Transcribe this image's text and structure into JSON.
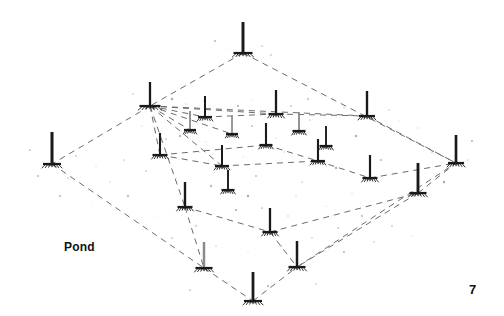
{
  "figure": {
    "pond_label": "Pond",
    "page_number": "7",
    "colors": {
      "background": "#ffffff",
      "pole_dark": "#1a1a1a",
      "pole_gray": "#8a8a8a",
      "link_line": "#6b6b6b",
      "speckle": "#9a9a9a",
      "text": "#111111"
    },
    "link_style": {
      "dash_pattern": "6 5",
      "stroke_width": 1.0
    },
    "hub_node_index": 1,
    "perimeter_path": [
      0,
      1,
      3,
      21,
      22,
      20
    ],
    "nodes": [
      {
        "id": "n0",
        "name": "apex-top",
        "x": 243,
        "y": 53,
        "pole_height": 31,
        "pole_shade": "dark",
        "base_width": 19
      },
      {
        "id": "n1",
        "name": "hub-left-upper",
        "x": 150,
        "y": 106,
        "pole_height": 24,
        "pole_shade": "dark",
        "base_width": 21
      },
      {
        "id": "n2",
        "name": "node-r1-a",
        "x": 205,
        "y": 117,
        "pole_height": 21,
        "pole_shade": "dark",
        "base_width": 14
      },
      {
        "id": "n3",
        "name": "node-r1-b",
        "x": 276,
        "y": 114,
        "pole_height": 24,
        "pole_shade": "dark",
        "base_width": 15
      },
      {
        "id": "n4",
        "name": "node-r1-c",
        "x": 367,
        "y": 116,
        "pole_height": 25,
        "pole_shade": "dark",
        "base_width": 16
      },
      {
        "id": "n5",
        "name": "node-r2-a",
        "x": 190,
        "y": 130,
        "pole_height": 19,
        "pole_shade": "gray",
        "base_width": 12
      },
      {
        "id": "n6",
        "name": "node-r2-b",
        "x": 232,
        "y": 134,
        "pole_height": 18,
        "pole_shade": "gray",
        "base_width": 12
      },
      {
        "id": "n7",
        "name": "node-r2-c",
        "x": 299,
        "y": 131,
        "pole_height": 19,
        "pole_shade": "gray",
        "base_width": 13
      },
      {
        "id": "n8",
        "name": "node-r2-d",
        "x": 326,
        "y": 146,
        "pole_height": 20,
        "pole_shade": "dark",
        "base_width": 13
      },
      {
        "id": "n9",
        "name": "node-left-vertex",
        "x": 52,
        "y": 164,
        "pole_height": 32,
        "pole_shade": "dark",
        "base_width": 18
      },
      {
        "id": "n10",
        "name": "node-r3-a",
        "x": 160,
        "y": 155,
        "pole_height": 22,
        "pole_shade": "dark",
        "base_width": 15
      },
      {
        "id": "n11",
        "name": "node-r3-b",
        "x": 222,
        "y": 166,
        "pole_height": 21,
        "pole_shade": "dark",
        "base_width": 14
      },
      {
        "id": "n12",
        "name": "node-r3-c",
        "x": 266,
        "y": 145,
        "pole_height": 22,
        "pole_shade": "dark",
        "base_width": 13
      },
      {
        "id": "n13",
        "name": "node-r3-d",
        "x": 318,
        "y": 161,
        "pole_height": 22,
        "pole_shade": "dark",
        "base_width": 14
      },
      {
        "id": "n14",
        "name": "node-r3-e",
        "x": 370,
        "y": 178,
        "pole_height": 23,
        "pole_shade": "dark",
        "base_width": 15
      },
      {
        "id": "n15",
        "name": "node-right-mid",
        "x": 418,
        "y": 193,
        "pole_height": 30,
        "pole_shade": "dark",
        "base_width": 17
      },
      {
        "id": "n16",
        "name": "node-right-vertex",
        "x": 456,
        "y": 163,
        "pole_height": 28,
        "pole_shade": "dark",
        "base_width": 16
      },
      {
        "id": "n17",
        "name": "node-r4-a",
        "x": 185,
        "y": 207,
        "pole_height": 25,
        "pole_shade": "dark",
        "base_width": 15
      },
      {
        "id": "n18",
        "name": "node-r4-b",
        "x": 228,
        "y": 190,
        "pole_height": 20,
        "pole_shade": "dark",
        "base_width": 13
      },
      {
        "id": "n19",
        "name": "node-r4-c",
        "x": 270,
        "y": 232,
        "pole_height": 24,
        "pole_shade": "dark",
        "base_width": 15
      },
      {
        "id": "n20",
        "name": "node-bottom-left",
        "x": 204,
        "y": 268,
        "pole_height": 26,
        "pole_shade": "gray",
        "base_width": 17
      },
      {
        "id": "n21",
        "name": "node-bottom-right",
        "x": 297,
        "y": 267,
        "pole_height": 26,
        "pole_shade": "dark",
        "base_width": 17
      },
      {
        "id": "n22",
        "name": "node-bottom-vertex",
        "x": 253,
        "y": 301,
        "pole_height": 29,
        "pole_shade": "dark",
        "base_width": 18
      }
    ],
    "links": [
      {
        "from": 0,
        "to": 1
      },
      {
        "from": 0,
        "to": 16
      },
      {
        "from": 1,
        "to": 9
      },
      {
        "from": 9,
        "to": 20
      },
      {
        "from": 20,
        "to": 22
      },
      {
        "from": 22,
        "to": 21
      },
      {
        "from": 21,
        "to": 16
      },
      {
        "from": 1,
        "to": 2
      },
      {
        "from": 1,
        "to": 3
      },
      {
        "from": 1,
        "to": 4
      },
      {
        "from": 1,
        "to": 5
      },
      {
        "from": 1,
        "to": 6
      },
      {
        "from": 1,
        "to": 10
      },
      {
        "from": 1,
        "to": 11
      },
      {
        "from": 1,
        "to": 17
      },
      {
        "from": 3,
        "to": 4
      },
      {
        "from": 2,
        "to": 3
      },
      {
        "from": 10,
        "to": 12
      },
      {
        "from": 12,
        "to": 13
      },
      {
        "from": 13,
        "to": 14
      },
      {
        "from": 14,
        "to": 16
      },
      {
        "from": 11,
        "to": 13
      },
      {
        "from": 17,
        "to": 19
      },
      {
        "from": 19,
        "to": 15
      },
      {
        "from": 15,
        "to": 16
      },
      {
        "from": 17,
        "to": 20
      },
      {
        "from": 19,
        "to": 21
      },
      {
        "from": 10,
        "to": 11
      },
      {
        "from": 4,
        "to": 16
      },
      {
        "from": 15,
        "to": 21
      }
    ],
    "speckles": [
      {
        "x": 120,
        "y": 86
      },
      {
        "x": 133,
        "y": 94
      },
      {
        "x": 172,
        "y": 99
      },
      {
        "x": 186,
        "y": 104
      },
      {
        "x": 215,
        "y": 41
      },
      {
        "x": 226,
        "y": 48
      },
      {
        "x": 262,
        "y": 46
      },
      {
        "x": 271,
        "y": 55
      },
      {
        "x": 204,
        "y": 101
      },
      {
        "x": 238,
        "y": 106
      },
      {
        "x": 252,
        "y": 100
      },
      {
        "x": 291,
        "y": 106
      },
      {
        "x": 308,
        "y": 99
      },
      {
        "x": 344,
        "y": 108
      },
      {
        "x": 389,
        "y": 110
      },
      {
        "x": 399,
        "y": 121
      },
      {
        "x": 30,
        "y": 150
      },
      {
        "x": 38,
        "y": 176
      },
      {
        "x": 68,
        "y": 178
      },
      {
        "x": 76,
        "y": 156
      },
      {
        "x": 96,
        "y": 166
      },
      {
        "x": 110,
        "y": 182
      },
      {
        "x": 128,
        "y": 196
      },
      {
        "x": 146,
        "y": 171
      },
      {
        "x": 166,
        "y": 139
      },
      {
        "x": 176,
        "y": 178
      },
      {
        "x": 199,
        "y": 152
      },
      {
        "x": 211,
        "y": 186
      },
      {
        "x": 243,
        "y": 157
      },
      {
        "x": 256,
        "y": 176
      },
      {
        "x": 284,
        "y": 152
      },
      {
        "x": 302,
        "y": 182
      },
      {
        "x": 336,
        "y": 168
      },
      {
        "x": 352,
        "y": 194
      },
      {
        "x": 381,
        "y": 160
      },
      {
        "x": 404,
        "y": 173
      },
      {
        "x": 432,
        "y": 152
      },
      {
        "x": 444,
        "y": 182
      },
      {
        "x": 468,
        "y": 160
      },
      {
        "x": 472,
        "y": 141
      },
      {
        "x": 158,
        "y": 216
      },
      {
        "x": 172,
        "y": 238
      },
      {
        "x": 196,
        "y": 226
      },
      {
        "x": 216,
        "y": 246
      },
      {
        "x": 236,
        "y": 210
      },
      {
        "x": 248,
        "y": 252
      },
      {
        "x": 262,
        "y": 208
      },
      {
        "x": 281,
        "y": 246
      },
      {
        "x": 288,
        "y": 216
      },
      {
        "x": 312,
        "y": 238
      },
      {
        "x": 326,
        "y": 206
      },
      {
        "x": 338,
        "y": 228
      },
      {
        "x": 362,
        "y": 216
      },
      {
        "x": 374,
        "y": 242
      },
      {
        "x": 392,
        "y": 226
      },
      {
        "x": 412,
        "y": 236
      },
      {
        "x": 228,
        "y": 282
      },
      {
        "x": 268,
        "y": 286
      },
      {
        "x": 316,
        "y": 284
      },
      {
        "x": 190,
        "y": 290
      },
      {
        "x": 142,
        "y": 126
      },
      {
        "x": 156,
        "y": 122
      },
      {
        "x": 180,
        "y": 136
      },
      {
        "x": 206,
        "y": 142
      },
      {
        "x": 252,
        "y": 126
      },
      {
        "x": 276,
        "y": 138
      },
      {
        "x": 310,
        "y": 120
      },
      {
        "x": 356,
        "y": 136
      },
      {
        "x": 418,
        "y": 128
      },
      {
        "x": 60,
        "y": 196
      },
      {
        "x": 92,
        "y": 206
      },
      {
        "x": 124,
        "y": 160
      },
      {
        "x": 248,
        "y": 196
      },
      {
        "x": 296,
        "y": 196
      },
      {
        "x": 344,
        "y": 252
      },
      {
        "x": 386,
        "y": 200
      }
    ]
  }
}
